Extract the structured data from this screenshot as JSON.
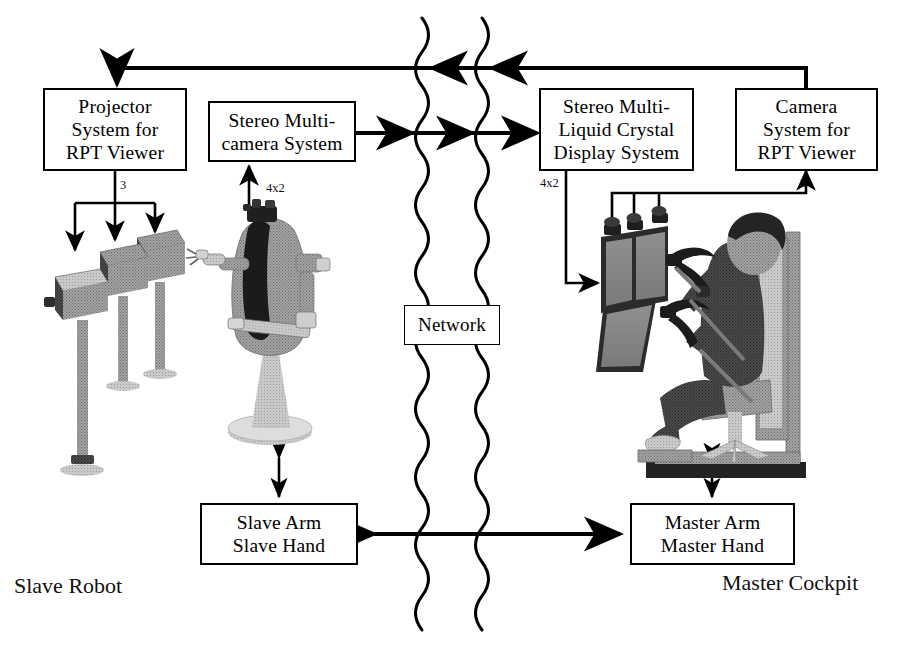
{
  "diagram": {
    "type": "block-diagram",
    "colors": {
      "line": "#000000",
      "box_fill": "#ffffff",
      "text": "#111111",
      "illustration_mid": "#9a9a9a",
      "illustration_dark": "#3c3c3c"
    },
    "boxes": [
      {
        "id": "projector-system",
        "label": "Projector\nSystem for\nRPT Viewer",
        "x": 43,
        "y": 88,
        "w": 144,
        "h": 83
      },
      {
        "id": "stereo-multicamera-system",
        "label": "Stereo Multi-\ncamera System",
        "x": 208,
        "y": 101,
        "w": 148,
        "h": 61
      },
      {
        "id": "stereo-multi-lcd-system",
        "label": "Stereo Multi-\nLiquid Crystal\nDisplay System",
        "x": 539,
        "y": 88,
        "w": 155,
        "h": 83
      },
      {
        "id": "camera-system",
        "label": "Camera\nSystem for\nRPT Viewer",
        "x": 735,
        "y": 88,
        "w": 143,
        "h": 83
      },
      {
        "id": "network",
        "label": "Network",
        "x": 404,
        "y": 305,
        "w": 96,
        "h": 40
      },
      {
        "id": "slave-arm-hand",
        "label": "Slave Arm\nSlave Hand",
        "x": 200,
        "y": 503,
        "w": 158,
        "h": 62
      },
      {
        "id": "master-arm-hand",
        "label": "Master Arm\nMaster Hand",
        "x": 630,
        "y": 503,
        "w": 165,
        "h": 62
      }
    ],
    "edge_labels": [
      {
        "id": "projector-channels",
        "text": "3",
        "x": 120,
        "y": 178
      },
      {
        "id": "slave-camera-channels",
        "text": "4x2",
        "x": 266,
        "y": 181
      },
      {
        "id": "display-channels",
        "text": "4x2",
        "x": 540,
        "y": 176
      },
      {
        "id": "master-camera-channels",
        "text": "3",
        "x": 800,
        "y": 176
      }
    ],
    "side_labels": [
      {
        "id": "slave-robot-label",
        "text": "Slave Robot",
        "x": 14,
        "y": 573
      },
      {
        "id": "master-cockpit-label",
        "text": "Master Cockpit",
        "x": 722,
        "y": 570
      }
    ],
    "illustrations": [
      {
        "id": "rpt-projector-array",
        "description": "three projectors on stands"
      },
      {
        "id": "slave-robot-figure",
        "description": "humanoid slave robot with arms on pedestal"
      },
      {
        "id": "multi-lcd-display-array",
        "description": "angled stereo LCD display panels with cameras on top"
      },
      {
        "id": "master-operator-figure",
        "description": "seated operator holding master arm handles in cockpit frame"
      }
    ],
    "connections": [
      {
        "id": "camera-to-projector-return",
        "from": "camera-system",
        "to": "projector-system",
        "direction": "left",
        "crosses_network": true
      },
      {
        "id": "slave-camera-to-display",
        "from": "stereo-multicamera-system",
        "to": "stereo-multi-lcd-system",
        "direction": "right",
        "crosses_network": true
      },
      {
        "id": "arm-hand-bidirectional",
        "from": "master-arm-hand",
        "to": "slave-arm-hand",
        "direction": "both",
        "crosses_network": true
      }
    ]
  }
}
